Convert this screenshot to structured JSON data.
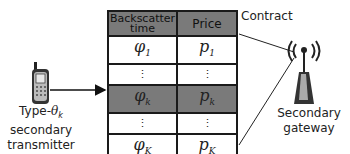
{
  "contract": {
    "label": "Contract",
    "headers": {
      "col1": "Backscatter time",
      "col2": "Price"
    },
    "rows": [
      {
        "phi": "φ",
        "phi_sub": "1",
        "p": "p",
        "p_sub": "1",
        "highlight": false
      },
      {
        "phi": "⋮",
        "p": "⋮",
        "highlight": false,
        "ellipsis": true
      },
      {
        "phi": "φ",
        "phi_sub": "k",
        "p": "p",
        "p_sub": "k",
        "highlight": true
      },
      {
        "phi": "⋮",
        "p": "⋮",
        "highlight": false,
        "ellipsis": true
      },
      {
        "phi": "φ",
        "phi_sub": "K",
        "p": "p",
        "p_sub": "K",
        "highlight": false
      }
    ]
  },
  "transmitter": {
    "icon": "mobile-phone-icon",
    "label_line1": "Type-θk",
    "label_prefix": "Type-",
    "label_theta": "θ",
    "label_theta_sub": "k",
    "label_line2": "secondary",
    "label_line3": "transmitter"
  },
  "gateway": {
    "icon": "antenna-tower-icon",
    "label_line1": "Secondary",
    "label_line2": "gateway"
  },
  "colors": {
    "highlight": "#7a7a7a",
    "border": "#1a1a1a",
    "text": "#222222"
  }
}
